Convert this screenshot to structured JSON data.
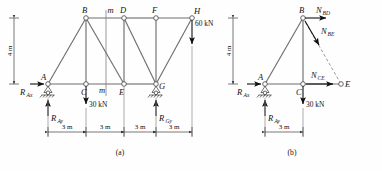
{
  "figure": {
    "panels": [
      {
        "id": "a",
        "caption": "(a)",
        "nodes": [
          {
            "name": "A",
            "label": "A"
          },
          {
            "name": "B",
            "label": "B"
          },
          {
            "name": "C",
            "label": "C"
          },
          {
            "name": "D",
            "label": "D"
          },
          {
            "name": "E",
            "label": "E"
          },
          {
            "name": "F",
            "label": "F"
          },
          {
            "name": "G",
            "label": "G"
          },
          {
            "name": "H",
            "label": "H"
          }
        ],
        "section_marks": [
          {
            "name": "section-m-top",
            "label": "m"
          },
          {
            "name": "section-m-bottom",
            "label": "m"
          }
        ],
        "loads": [
          {
            "name": "load-30kn",
            "label": "30 kN",
            "at": "C",
            "direction": "down"
          },
          {
            "name": "load-60kn",
            "label": "60 kN",
            "at": "H",
            "direction": "down"
          }
        ],
        "reactions": [
          {
            "name": "reaction-rax",
            "label": "R",
            "sub": "Ax",
            "at": "A",
            "direction": "right"
          },
          {
            "name": "reaction-ray",
            "label": "R",
            "sub": "Ay",
            "at": "A",
            "direction": "up"
          },
          {
            "name": "reaction-rgy",
            "label": "R",
            "sub": "Gy",
            "at": "G",
            "direction": "up"
          }
        ],
        "height_dim": {
          "name": "height-dimension",
          "label": "4 m"
        },
        "span_dims": [
          {
            "name": "span-dim-1",
            "label": "3 m"
          },
          {
            "name": "span-dim-2",
            "label": "3 m"
          },
          {
            "name": "span-dim-3",
            "label": "3 m"
          },
          {
            "name": "span-dim-4",
            "label": "3 m"
          }
        ]
      },
      {
        "id": "b",
        "caption": "(b)",
        "nodes": [
          {
            "name": "A",
            "label": "A"
          },
          {
            "name": "B",
            "label": "B"
          },
          {
            "name": "C",
            "label": "C"
          },
          {
            "name": "E",
            "label": "E"
          }
        ],
        "member_forces": [
          {
            "name": "force-nbd",
            "label": "N",
            "sub": "BD",
            "at": "B",
            "direction": "right"
          },
          {
            "name": "force-nbe",
            "label": "N",
            "sub": "BE",
            "at": "B",
            "direction": "down-right"
          },
          {
            "name": "force-nce",
            "label": "N",
            "sub": "CE",
            "at": "C",
            "direction": "right"
          }
        ],
        "loads": [
          {
            "name": "load-30kn",
            "label": "30 kN",
            "at": "C",
            "direction": "down"
          }
        ],
        "reactions": [
          {
            "name": "reaction-rax",
            "label": "R",
            "sub": "Ax",
            "at": "A",
            "direction": "right"
          },
          {
            "name": "reaction-ray",
            "label": "R",
            "sub": "Ay",
            "at": "A",
            "direction": "up"
          }
        ],
        "height_dim": {
          "name": "height-dimension",
          "label": "4 m"
        },
        "span_dims": [
          {
            "name": "span-dim-1",
            "label": "3 m"
          }
        ]
      }
    ]
  }
}
